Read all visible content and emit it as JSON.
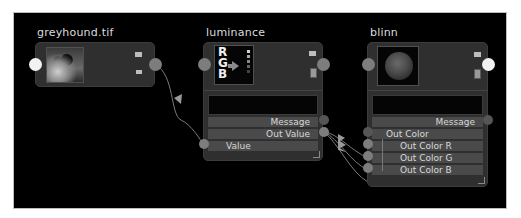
{
  "editor": {
    "name": "node-editor",
    "background_color": "#000000",
    "node_color": "#2f2f2f",
    "attr_row_color": "#4a4a4a",
    "port_color": "#7d7d7d"
  },
  "nodes": {
    "greyhound": {
      "title": "greyhound.tif",
      "thumbnail": "greyhound-image-thumbnail"
    },
    "luminance": {
      "title": "luminance",
      "swatch_text": [
        "R",
        "G",
        "B"
      ],
      "attributes": {
        "message": "Message",
        "out_value": "Out Value",
        "value": "Value"
      }
    },
    "blinn": {
      "title": "blinn",
      "thumbnail": "blinn-sphere-swatch",
      "attributes": {
        "message": "Message",
        "out_color": "Out Color",
        "out_color_r": "Out Color R",
        "out_color_g": "Out Color G",
        "out_color_b": "Out Color B"
      }
    }
  },
  "connections": [
    {
      "from": "greyhound.tif output",
      "to": "luminance.Value"
    },
    {
      "from": "luminance.Out Value",
      "to": "blinn.Out Color R"
    },
    {
      "from": "luminance.Out Value",
      "to": "blinn.Out Color G"
    },
    {
      "from": "luminance.Out Value",
      "to": "blinn.Out Color B"
    }
  ]
}
